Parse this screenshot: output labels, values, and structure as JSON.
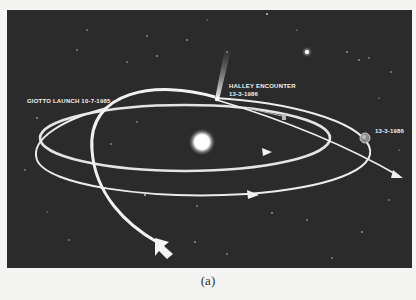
{
  "figure": {
    "labels": {
      "launch": "GIOTTO LAUNCH 10-7-1985",
      "encounter_line1": "HALLEY ENCOUNTER",
      "encounter_line2": "13-3-1986",
      "earth_date": "13-3-1986"
    },
    "elements": [
      "Sun",
      "Earth",
      "Halley's Comet",
      "Giotto trajectory",
      "Earth orbit",
      "Comet orbit",
      "Bright star"
    ],
    "colors": {
      "background": "#2b2b2b",
      "orbit": "#e8e8e8",
      "page": "#f4f4f2"
    }
  },
  "caption": "(a)"
}
